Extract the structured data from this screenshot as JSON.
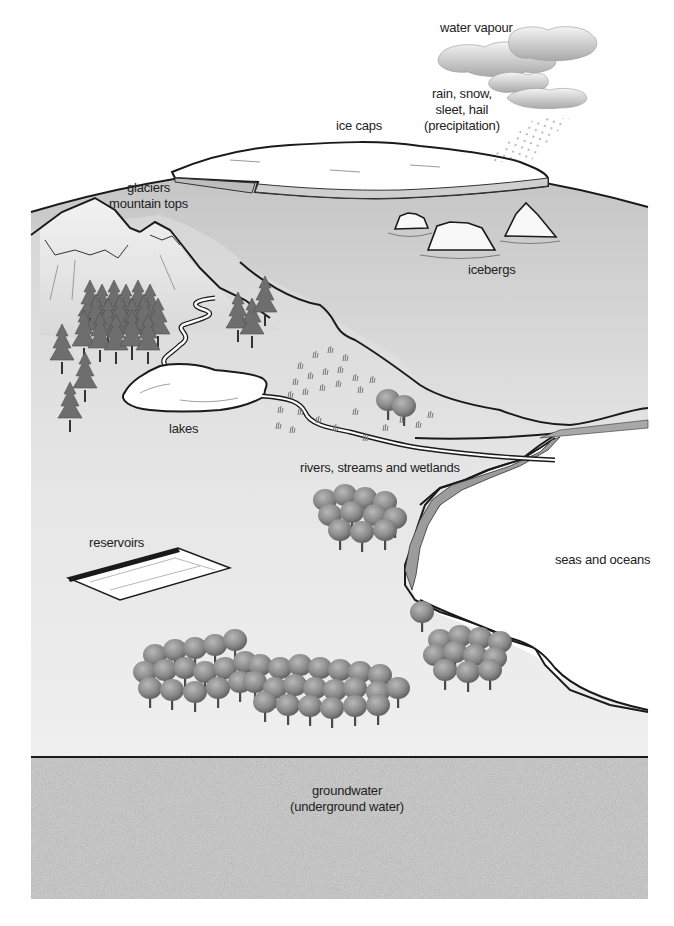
{
  "diagram": {
    "type": "water-distribution-landscape",
    "labels": {
      "water_vapour": "water vapour",
      "precipitation_line1": "rain, snow,",
      "precipitation_line2": "sleet, hail",
      "precipitation_line3": "(precipitation)",
      "ice_caps": "ice caps",
      "glaciers_line1": "glaciers",
      "glaciers_line2": "mountain tops",
      "icebergs": "icebergs",
      "lakes": "lakes",
      "rivers": "rivers, streams and wetlands",
      "reservoirs": "reservoirs",
      "seas": "seas and oceans",
      "groundwater_line1": "groundwater",
      "groundwater_line2": "(underground water)"
    },
    "icons": {
      "clouds": "cloud-icon",
      "rain": "rain-dots-icon",
      "ice_cap": "ice-shelf-icon",
      "icebergs": "iceberg-icon",
      "mountains": "mountain-icon",
      "conifers": "pine-tree-icon",
      "deciduous": "round-tree-icon",
      "wetland_grass": "grass-tuft-icon",
      "reservoir": "reservoir-icon"
    },
    "colors": {
      "background": "#ffffff",
      "land": "#e4e4e4",
      "sea_distant": "#c9c9c9",
      "water": "#ffffff",
      "outline": "#1a1a1a",
      "groundwater": "#d2d2d2",
      "text": "#222222"
    }
  }
}
